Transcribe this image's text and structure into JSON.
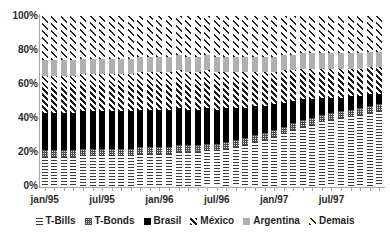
{
  "chart_data": {
    "type": "bar",
    "stacked": true,
    "stack_mode": "percent",
    "title": "",
    "subtitle": "",
    "xlabel": "",
    "ylabel": "",
    "ylim": [
      0,
      100
    ],
    "ytick_labels": [
      "0%",
      "20%",
      "40%",
      "60%",
      "80%",
      "100%"
    ],
    "ytick_values": [
      0,
      20,
      40,
      60,
      80,
      100
    ],
    "grid": false,
    "legend_position": "bottom",
    "legend_entries": [
      "T-Bills",
      "T-Bonds",
      "Brasil",
      "México",
      "Argentina",
      "Demais"
    ],
    "categories": [
      "jan/95",
      "fev/95",
      "mar/95",
      "abr/95",
      "mai/95",
      "jun/95",
      "jul/95",
      "ago/95",
      "set/95",
      "out/95",
      "nov/95",
      "dez/95",
      "jan/96",
      "fev/96",
      "mar/96",
      "abr/96",
      "mai/96",
      "jun/96",
      "jul/96",
      "ago/96",
      "set/96",
      "out/96",
      "nov/96",
      "dez/96",
      "jan/97",
      "fev/97",
      "mar/97",
      "abr/97",
      "mai/97",
      "jun/97",
      "jul/97",
      "ago/97",
      "set/97",
      "out/97",
      "nov/97",
      "dez/97"
    ],
    "xtick_labels": [
      "jan/95",
      "jul/95",
      "jan/96",
      "jul/96",
      "jan/97",
      "jul/97"
    ],
    "xtick_category_index": [
      0,
      6,
      12,
      18,
      24,
      30
    ],
    "series": [
      {
        "name": "T-Bills",
        "pattern": "horizontal-lines",
        "values": [
          17,
          17,
          17,
          17,
          18,
          18,
          18,
          18,
          18,
          18,
          19,
          19,
          19,
          19,
          20,
          20,
          20,
          21,
          21,
          22,
          23,
          24,
          26,
          27,
          29,
          31,
          33,
          35,
          36,
          38,
          39,
          40,
          41,
          42,
          43,
          44
        ]
      },
      {
        "name": "T-Bonds",
        "pattern": "checker",
        "values": [
          4,
          4,
          4,
          4,
          4,
          4,
          4,
          4,
          4,
          4,
          4,
          4,
          4,
          4,
          4,
          4,
          4,
          4,
          4,
          4,
          4,
          4,
          4,
          4,
          4,
          4,
          4,
          4,
          4,
          4,
          4,
          4,
          4,
          4,
          4,
          4
        ]
      },
      {
        "name": "Brasil",
        "pattern": "solid-black",
        "values": [
          22,
          22,
          22,
          22,
          22,
          22,
          22,
          22,
          22,
          22,
          22,
          22,
          22,
          22,
          22,
          21,
          21,
          21,
          20,
          20,
          19,
          18,
          17,
          16,
          15,
          14,
          13,
          12,
          11,
          10,
          9,
          8,
          8,
          7,
          7,
          6
        ]
      },
      {
        "name": "México",
        "pattern": "dense-diagonal-hatch",
        "values": [
          22,
          22,
          22,
          22,
          22,
          22,
          22,
          22,
          22,
          22,
          22,
          22,
          22,
          22,
          22,
          22,
          22,
          22,
          22,
          21,
          21,
          21,
          20,
          20,
          19,
          19,
          18,
          18,
          18,
          17,
          17,
          17,
          16,
          16,
          16,
          16
        ]
      },
      {
        "name": "Argentina",
        "pattern": "solid-grey",
        "values": [
          9,
          9,
          9,
          9,
          9,
          9,
          9,
          9,
          9,
          9,
          9,
          9,
          9,
          9,
          9,
          9,
          9,
          9,
          9,
          9,
          9,
          9,
          9,
          9,
          9,
          9,
          9,
          9,
          9,
          9,
          9,
          9,
          9,
          9,
          9,
          9
        ]
      },
      {
        "name": "Demais",
        "pattern": "sparse-diagonal-hatch",
        "values": [
          26,
          26,
          26,
          26,
          25,
          25,
          25,
          25,
          25,
          25,
          24,
          24,
          24,
          24,
          23,
          24,
          24,
          23,
          24,
          24,
          24,
          24,
          24,
          24,
          24,
          23,
          23,
          22,
          22,
          22,
          22,
          22,
          22,
          22,
          21,
          21
        ]
      }
    ]
  }
}
